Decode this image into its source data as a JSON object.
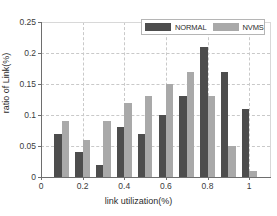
{
  "chart_data": {
    "type": "bar",
    "title": "",
    "xlabel": "link utilization(%)",
    "ylabel": "ratio of Link(%)",
    "xlim": [
      0,
      1.1
    ],
    "ylim": [
      0,
      0.25
    ],
    "grid": true,
    "legend_position": "top-right",
    "x": [
      0.1,
      0.2,
      0.3,
      0.4,
      0.5,
      0.6,
      0.7,
      0.8,
      0.9,
      1.0
    ],
    "categories": [
      "0.1",
      "0.2",
      "0.3",
      "0.4",
      "0.5",
      "0.6",
      "0.7",
      "0.8",
      "0.9",
      "1"
    ],
    "series": [
      {
        "name": "NORMAL",
        "color": "#4d4d4d",
        "values": [
          0.07,
          0.04,
          0.02,
          0.08,
          0.07,
          0.1,
          0.13,
          0.21,
          0.17,
          0.11
        ]
      },
      {
        "name": "NVMS",
        "color": "#a9a9a9",
        "values": [
          0.09,
          0.06,
          0.09,
          0.12,
          0.13,
          0.15,
          0.17,
          0.13,
          0.05,
          0.01
        ]
      }
    ],
    "xticks": [
      {
        "value": 0,
        "label": "0"
      },
      {
        "value": 0.2,
        "label": "0.2"
      },
      {
        "value": 0.4,
        "label": "0.4"
      },
      {
        "value": 0.6,
        "label": "0.6"
      },
      {
        "value": 0.8,
        "label": "0.8"
      },
      {
        "value": 1.0,
        "label": "1"
      }
    ],
    "yticks": [
      {
        "value": 0,
        "label": "0"
      },
      {
        "value": 0.05,
        "label": "0.05"
      },
      {
        "value": 0.1,
        "label": "0.1"
      },
      {
        "value": 0.15,
        "label": "0.15"
      },
      {
        "value": 0.2,
        "label": "0.2"
      },
      {
        "value": 0.25,
        "label": "0.25"
      }
    ]
  }
}
